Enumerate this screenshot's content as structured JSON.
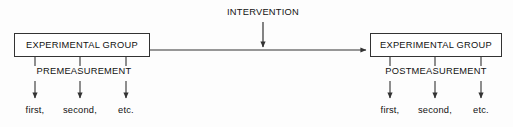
{
  "diagram": {
    "background_color": "#fdfdfd",
    "line_color": "#333333",
    "text_color": "#111111",
    "nodes": {
      "pre_group": {
        "label": "EXPERIMENTAL GROUP"
      },
      "post_group": {
        "label": "EXPERIMENTAL GROUP"
      }
    },
    "labels": {
      "intervention": "INTERVENTION",
      "premeasurement": "PREMEASUREMENT",
      "postmeasurement": "POSTMEASUREMENT"
    },
    "pre_occasions": [
      {
        "label": "first,"
      },
      {
        "label": "second,"
      },
      {
        "label": "etc."
      }
    ],
    "post_occasions": [
      {
        "label": "first,"
      },
      {
        "label": "second,"
      },
      {
        "label": "etc."
      }
    ]
  }
}
